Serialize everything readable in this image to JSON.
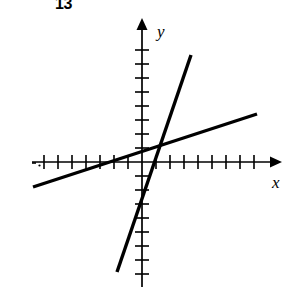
{
  "figure": {
    "problem_number": "13",
    "type": "coordinate-graph"
  },
  "axes": {
    "x_label": "x",
    "y_label": "y",
    "x_axis_color": "#000000",
    "y_axis_color": "#000000",
    "origin_px": {
      "x": 142,
      "y": 162
    },
    "tick_spacing_px": 14,
    "x_axis_start_px": 32,
    "x_axis_end_px": 278,
    "y_axis_top_px": 24,
    "y_axis_bottom_px": 287,
    "x_ticks_negative": 7,
    "x_ticks_positive": 8,
    "y_ticks_positive": 8,
    "y_ticks_negative": 8,
    "arrow_x": true,
    "arrow_y": true,
    "gridlines": false
  },
  "chart_data": {
    "type": "line",
    "title": "",
    "xlabel": "x",
    "ylabel": "y",
    "xlim": [
      -7.9,
      9.7
    ],
    "ylim": [
      -8.9,
      9.9
    ],
    "grid": false,
    "legend": "none",
    "series": [
      {
        "name": "steep-line",
        "slope": 3.05,
        "y_intercept": -4.4,
        "x_intercept": 1.45,
        "points_px": [
          {
            "x": 191,
            "y": 55
          },
          {
            "x": 117,
            "y": 272
          }
        ],
        "points_data": [
          {
            "x": 3.5,
            "y": 7.64
          },
          {
            "x": -1.79,
            "y": -7.86
          }
        ],
        "stroke": "#000000",
        "stroke_width": 3.4
      },
      {
        "name": "shallow-line",
        "slope": 0.325,
        "y_intercept": 1.07,
        "x_intercept": -3.3,
        "points_px": [
          {
            "x": 33,
            "y": 187
          },
          {
            "x": 257,
            "y": 114
          }
        ],
        "points_data": [
          {
            "x": -7.79,
            "y": -1.79
          },
          {
            "x": 8.21,
            "y": 3.43
          }
        ],
        "stroke": "#000000",
        "stroke_width": 3.4
      }
    ],
    "intersection_px": {
      "x": 163,
      "y": 142
    },
    "intersection_data": {
      "x": 1.5,
      "y": 1.43
    }
  },
  "colors": {
    "background": "#ffffff",
    "ink": "#000000"
  }
}
